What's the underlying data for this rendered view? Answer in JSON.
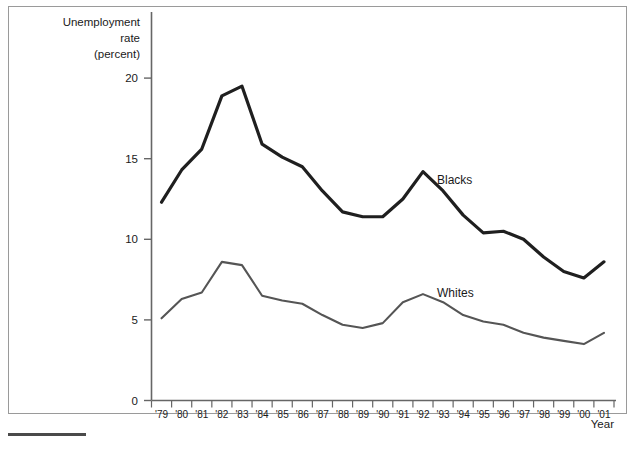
{
  "figure": {
    "y_axis_title_lines": [
      "Unemployment",
      "rate",
      "(percent)"
    ],
    "x_axis_title": "Year",
    "y_ticks": [
      "0",
      "5",
      "10",
      "15",
      "20"
    ],
    "x_ticks": [
      "'79",
      "'80",
      "'81",
      "'82",
      "'83",
      "'84",
      "'85",
      "'86",
      "'87",
      "'88",
      "'89",
      "'90",
      "'91",
      "'92",
      "'93",
      "'94",
      "'95",
      "'96",
      "'97",
      "'98",
      "'99",
      "'00",
      "'01"
    ],
    "series_labels": {
      "blacks": "Blacks",
      "whites": "Whites"
    },
    "colors": {
      "blacks_line": "#1f1f1f",
      "whites_line": "#555555",
      "axis": "#666666",
      "frame": "#9a9a9a",
      "text": "#1a1a1a"
    }
  },
  "chart_data": {
    "type": "line",
    "title": "",
    "subtitle": "",
    "xlabel": "Year",
    "ylabel": "Unemployment rate (percent)",
    "categories": [
      "'79",
      "'80",
      "'81",
      "'82",
      "'83",
      "'84",
      "'85",
      "'86",
      "'87",
      "'88",
      "'89",
      "'90",
      "'91",
      "'92",
      "'93",
      "'94",
      "'95",
      "'96",
      "'97",
      "'98",
      "'99",
      "'00",
      "'01"
    ],
    "x": [
      1979,
      1980,
      1981,
      1982,
      1983,
      1984,
      1985,
      1986,
      1987,
      1988,
      1989,
      1990,
      1991,
      1992,
      1993,
      1994,
      1995,
      1996,
      1997,
      1998,
      1999,
      2000,
      2001
    ],
    "series": [
      {
        "name": "Blacks",
        "values": [
          12.3,
          14.3,
          15.6,
          18.9,
          19.5,
          15.9,
          15.1,
          14.5,
          13.0,
          11.7,
          11.4,
          11.4,
          12.5,
          14.2,
          13.0,
          11.5,
          10.4,
          10.5,
          10.0,
          8.9,
          8.0,
          7.6,
          8.6
        ]
      },
      {
        "name": "Whites",
        "values": [
          5.1,
          6.3,
          6.7,
          8.6,
          8.4,
          6.5,
          6.2,
          6.0,
          5.3,
          4.7,
          4.5,
          4.8,
          6.1,
          6.6,
          6.1,
          5.3,
          4.9,
          4.7,
          4.2,
          3.9,
          3.7,
          3.5,
          4.2
        ]
      }
    ],
    "xlim": [
      1979,
      2001
    ],
    "ylim": [
      0,
      21
    ],
    "grid": false,
    "legend": "inline-annotations",
    "annotations": [
      {
        "text": "Blacks",
        "series": "Blacks",
        "near_year": 1993
      },
      {
        "text": "Whites",
        "series": "Whites",
        "near_year": 1993
      }
    ]
  }
}
